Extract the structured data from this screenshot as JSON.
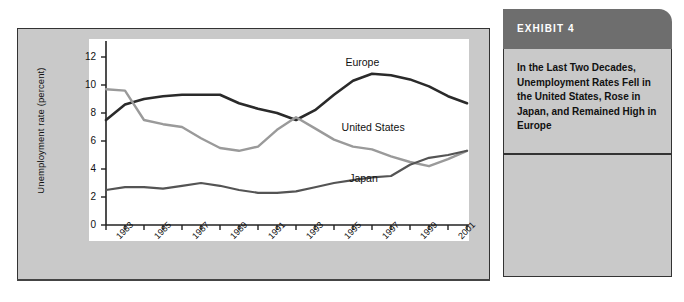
{
  "exhibit": {
    "header_label": "EXHIBIT 4",
    "caption": "In the Last Two Decades, Unemployment Rates Fell in the United States, Rose in Japan, and Remained High in Europe"
  },
  "colors": {
    "europe": "#2a2a2a",
    "united_states": "#9a9a9a",
    "japan": "#545454",
    "panel_gray": "#c9c9c9",
    "header_gray": "#6e6e6e",
    "plot_white": "#ffffff",
    "axis": "#222222"
  },
  "chart_data": {
    "type": "line",
    "title": "",
    "xlabel": "",
    "ylabel": "Unemployment rate (percent)",
    "ylim": [
      0,
      13
    ],
    "yticks": [
      0,
      2,
      4,
      6,
      8,
      10,
      12
    ],
    "ytick_labels": [
      "0",
      "2",
      "4",
      "6",
      "8",
      "10",
      "12"
    ],
    "xlim": [
      1982,
      2001
    ],
    "xticks": [
      1982,
      1983,
      1984,
      1985,
      1986,
      1987,
      1988,
      1989,
      1990,
      1991,
      1992,
      1993,
      1994,
      1995,
      1996,
      1997,
      1998,
      1999,
      2000,
      2001
    ],
    "xtick_labels": [
      "1983",
      "1985",
      "1987",
      "1989",
      "1991",
      "1993",
      "1995",
      "1997",
      "1999",
      "2001"
    ],
    "xtick_label_years": [
      1983,
      1985,
      1987,
      1989,
      1991,
      1993,
      1995,
      1997,
      1999,
      2001
    ],
    "grid": false,
    "legend": "inline-labels",
    "x": [
      1982,
      1983,
      1984,
      1985,
      1986,
      1987,
      1988,
      1989,
      1990,
      1991,
      1992,
      1993,
      1994,
      1995,
      1996,
      1997,
      1998,
      1999,
      2000,
      2001
    ],
    "series": [
      {
        "name": "Europe",
        "color": "#2a2a2a",
        "width": 2.6,
        "values": [
          7.5,
          8.6,
          9.0,
          9.2,
          9.3,
          9.3,
          9.3,
          8.7,
          8.3,
          8.0,
          7.5,
          8.2,
          9.3,
          10.3,
          10.8,
          10.7,
          10.4,
          9.9,
          9.2,
          8.7
        ],
        "label_at": {
          "year": 1994.6,
          "value": 11.6
        }
      },
      {
        "name": "United States",
        "color": "#9a9a9a",
        "width": 2.4,
        "values": [
          9.7,
          9.6,
          7.5,
          7.2,
          7.0,
          6.2,
          5.5,
          5.3,
          5.6,
          6.8,
          7.7,
          6.9,
          6.1,
          5.6,
          5.4,
          4.9,
          4.5,
          4.2,
          4.7,
          5.3
        ],
        "label_at": {
          "year": 1994.4,
          "value": 6.9
        }
      },
      {
        "name": "Japan",
        "color": "#545454",
        "width": 2.2,
        "values": [
          2.5,
          2.7,
          2.7,
          2.6,
          2.8,
          3.0,
          2.8,
          2.5,
          2.3,
          2.3,
          2.4,
          2.7,
          3.0,
          3.2,
          3.4,
          3.5,
          4.3,
          4.8,
          5.0,
          5.3
        ],
        "label_at": {
          "year": 1994.8,
          "value": 3.3
        }
      }
    ]
  }
}
